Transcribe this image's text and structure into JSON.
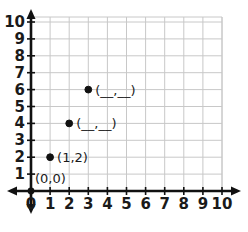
{
  "chart_data": {
    "type": "scatter",
    "title": "",
    "xlabel": "",
    "ylabel": "",
    "xlim": [
      0,
      10
    ],
    "ylim": [
      0,
      10
    ],
    "grid": true,
    "legend": null,
    "x_tick_labels": [
      "0",
      "1",
      "2",
      "3",
      "4",
      "5",
      "6",
      "7",
      "8",
      "9",
      "10"
    ],
    "y_tick_labels": [
      "1",
      "2",
      "3",
      "4",
      "5",
      "6",
      "7",
      "8",
      "9",
      "10"
    ],
    "x_ticks": [
      0,
      1,
      2,
      3,
      4,
      5,
      6,
      7,
      8,
      9,
      10
    ],
    "y_ticks": [
      1,
      2,
      3,
      4,
      5,
      6,
      7,
      8,
      9,
      10
    ],
    "points": [
      {
        "x": 1,
        "y": 2,
        "label": "(1,2)",
        "filled": true
      },
      {
        "x": 2,
        "y": 4,
        "label": "(__,__)",
        "filled": true
      },
      {
        "x": 3,
        "y": 6,
        "label": "(__,__)",
        "filled": true
      }
    ],
    "annotations": [
      {
        "text": "(0,0)",
        "x": 0,
        "y": 0,
        "name": "origin-label"
      }
    ],
    "series": [
      {
        "name": "plotted-points",
        "x": [
          1,
          2,
          3
        ],
        "y": [
          2,
          4,
          6
        ]
      }
    ],
    "colors": {
      "gridline": "#c8c8c8",
      "axis": "#111111",
      "point": "#111111",
      "text": "#1a1a1a",
      "background": "#ffffff"
    }
  }
}
